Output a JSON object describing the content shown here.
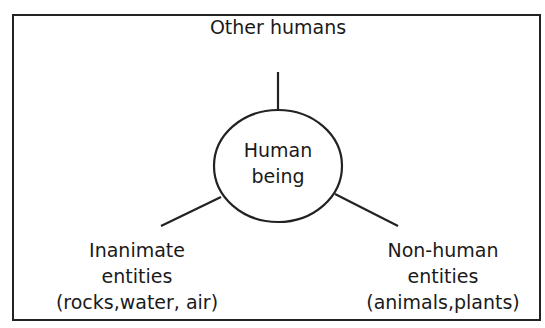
{
  "diagram": {
    "center": {
      "line1": "Human",
      "line2": "being"
    },
    "top": {
      "label": "Other humans"
    },
    "left": {
      "line1": "Inanimate",
      "line2": "entities",
      "line3": "(rocks,water, air)"
    },
    "right": {
      "line1": "Non-human",
      "line2": "entities",
      "line3": "(animals,plants)"
    }
  },
  "colors": {
    "stroke": "#222222",
    "background": "#ffffff"
  }
}
